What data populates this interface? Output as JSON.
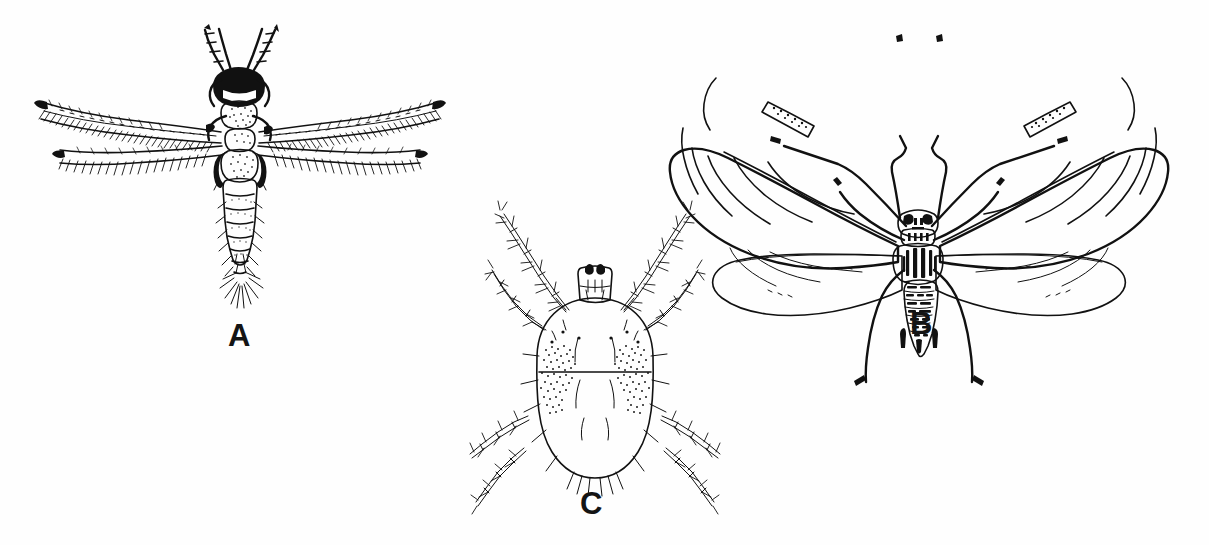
{
  "plate": {
    "title": "Sucking pest arthropods figure plate",
    "background_color": "#fefefe",
    "ink_color": "#111111",
    "width": 1209,
    "height": 545
  },
  "panels": [
    {
      "id": "A",
      "label": "A",
      "subject": "thrips",
      "description": "Adult thrips, dorsal view, with narrow fringed wings",
      "label_x": 228,
      "label_y": 320
    },
    {
      "id": "B",
      "label": "B",
      "subject": "winged-aphid",
      "description": "Winged adult aphid, dorsal view, with clear membranous veined wings",
      "label_x": 910,
      "label_y": 308
    },
    {
      "id": "C",
      "label": "C",
      "subject": "spider-mite",
      "description": "Spider mite, dorsal view, with eight setose legs and paired dark body blotches",
      "label_x": 580,
      "label_y": 490
    }
  ]
}
